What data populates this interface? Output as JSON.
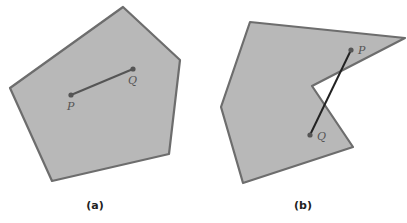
{
  "figure": {
    "panels": [
      {
        "id": "a",
        "caption": "(a)",
        "polygon_type": "convex",
        "vertices": [
          [
            123,
            7
          ],
          [
            180,
            60
          ],
          [
            169,
            154
          ],
          [
            52,
            181
          ],
          [
            10,
            88
          ]
        ],
        "segment": {
          "from": "P",
          "to": "Q"
        },
        "points": {
          "P": {
            "label": "P",
            "x": 71,
            "y": 95
          },
          "Q": {
            "label": "Q",
            "x": 133,
            "y": 69
          }
        },
        "fill_color": "#b8b8b8",
        "stroke_color": "#6d6d6d"
      },
      {
        "id": "b",
        "caption": "(b)",
        "polygon_type": "non-convex",
        "vertices": [
          [
            250,
            22
          ],
          [
            405,
            38
          ],
          [
            312,
            86
          ],
          [
            353,
            147
          ],
          [
            243,
            183
          ],
          [
            221,
            107
          ]
        ],
        "segment": {
          "from": "P",
          "to": "Q"
        },
        "points": {
          "P": {
            "label": "P",
            "x": 351,
            "y": 50
          },
          "Q": {
            "label": "Q",
            "x": 310,
            "y": 135
          }
        },
        "fill_color": "#b8b8b8",
        "stroke_color": "#6d6d6d"
      }
    ]
  }
}
